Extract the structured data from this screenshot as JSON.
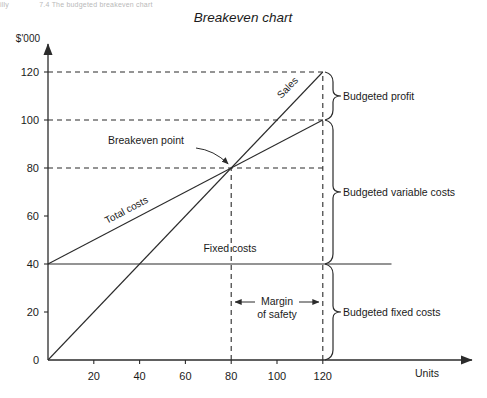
{
  "header": {
    "crumb_fragment_left": "illy",
    "crumb_fragment_right": "7.4 The budgeted breakeven chart"
  },
  "chart_data": {
    "type": "line",
    "title": "Breakeven chart",
    "xlabel": "Units",
    "ylabel": "$'000",
    "xlim": [
      0,
      160
    ],
    "ylim": [
      0,
      130
    ],
    "xticks": [
      20,
      40,
      60,
      80,
      100,
      120
    ],
    "yticks": [
      0,
      20,
      40,
      60,
      80,
      100,
      120
    ],
    "grid": false,
    "legend": "inline-labels",
    "series": [
      {
        "name": "Sales",
        "label": "Sales",
        "x": [
          0,
          120
        ],
        "values": [
          0,
          120
        ]
      },
      {
        "name": "Total costs",
        "label": "Total costs",
        "x": [
          0,
          120
        ],
        "values": [
          40,
          100
        ]
      },
      {
        "name": "Fixed costs",
        "label": "Fixed costs",
        "x": [
          0,
          150
        ],
        "values": [
          40,
          40
        ]
      }
    ],
    "annotations": {
      "breakeven_point": {
        "label": "Breakeven point",
        "x": 80,
        "y": 80
      },
      "margin_of_safety": {
        "label_line1": "Margin",
        "label_line2": "of safety",
        "from_x": 80,
        "to_x": 120
      },
      "budgeted_profit": {
        "label": "Budgeted profit",
        "from_y": 100,
        "to_y": 120
      },
      "budgeted_variable_costs": {
        "label": "Budgeted variable costs",
        "from_y": 40,
        "to_y": 100
      },
      "budgeted_fixed_costs": {
        "label": "Budgeted fixed costs",
        "from_y": 0,
        "to_y": 40
      }
    },
    "guide_lines": {
      "horizontal_at": [
        80,
        100,
        120
      ],
      "vertical_at": [
        80,
        120
      ]
    },
    "colors": {
      "ink": "#2b2b2b",
      "background": "#ffffff"
    }
  }
}
